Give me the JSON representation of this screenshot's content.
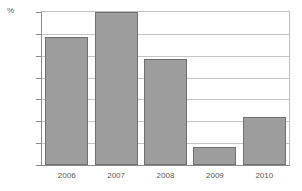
{
  "chart_data": {
    "type": "bar",
    "title": "",
    "subtitle": "",
    "xlabel": "",
    "ylabel": "%",
    "unit_label": "%",
    "categories": [
      "2006",
      "2007",
      "2008",
      "2009",
      "2010"
    ],
    "values": [
      2.92,
      3.5,
      2.42,
      0.42,
      1.1
    ],
    "series": [
      {
        "name": "",
        "values": [
          2.92,
          3.5,
          2.42,
          0.42,
          1.1
        ]
      }
    ],
    "ylim": [
      0.0,
      3.5
    ],
    "ytick_labels": [
      "0.0",
      "0.5",
      "1.0",
      "1.5",
      "2.0",
      "2.5",
      "3.0",
      "3.5"
    ],
    "ytick_values": [
      0.0,
      0.5,
      1.0,
      1.5,
      2.0,
      2.5,
      3.0,
      3.5
    ],
    "grid": true,
    "legend": false,
    "legend_position": "none",
    "colors": {
      "bar_fill": "#9d9d9d",
      "bar_border": "#6f6f71",
      "gridline": "#c4c4c6",
      "axis": "#8c8c8e",
      "text": "#58585a",
      "background": "#ffffff"
    }
  }
}
